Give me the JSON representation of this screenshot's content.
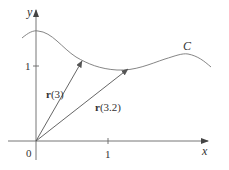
{
  "figure": {
    "type": "vector-function-curve",
    "axes": {
      "x_label": "x",
      "y_label": "y",
      "origin_label": "0",
      "x_tick_label": "1",
      "y_tick_label": "1"
    },
    "curve": {
      "label": "C"
    },
    "vectors": [
      {
        "label_bold": "r",
        "label_arg": "(3)",
        "param": 3
      },
      {
        "label_bold": "r",
        "label_arg": "(3.2)",
        "param": 3.2
      }
    ],
    "colors": {
      "axis": "#555555",
      "curve": "#777777",
      "vector": "#555555",
      "text": "#333333"
    }
  }
}
